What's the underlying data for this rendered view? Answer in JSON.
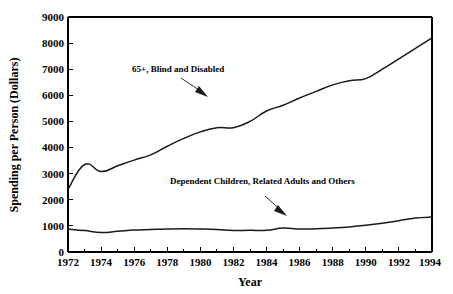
{
  "chart_data": {
    "type": "line",
    "title": "",
    "xlabel": "Year",
    "ylabel": "Spending per Person (Dollars)",
    "xlim": [
      1972,
      1994
    ],
    "ylim": [
      0,
      9000
    ],
    "grid": false,
    "legend": "none (in-plot annotations with arrows)",
    "x": [
      1972,
      1973,
      1974,
      1975,
      1976,
      1977,
      1978,
      1979,
      1980,
      1981,
      1982,
      1983,
      1984,
      1985,
      1986,
      1987,
      1988,
      1989,
      1990,
      1991,
      1992,
      1993,
      1994
    ],
    "xticks": [
      1972,
      1974,
      1976,
      1978,
      1980,
      1982,
      1984,
      1986,
      1988,
      1990,
      1992,
      1994
    ],
    "xtick_labels": [
      "1972",
      "1974",
      "1976",
      "1978",
      "1980",
      "1982",
      "1984",
      "1986",
      "1988",
      "1990",
      "1992",
      "1994"
    ],
    "yticks": [
      0,
      1000,
      2000,
      3000,
      4000,
      5000,
      6000,
      7000,
      8000,
      9000
    ],
    "ytick_labels": [
      "0",
      "1000",
      "2000",
      "3000",
      "4000",
      "5000",
      "6000",
      "7000",
      "8000",
      "9000"
    ],
    "series": [
      {
        "name": "65+, Blind and Disabled",
        "color": "#1a1a1a",
        "values": [
          2400,
          3350,
          3080,
          3300,
          3520,
          3720,
          4050,
          4350,
          4600,
          4760,
          4760,
          5000,
          5400,
          5620,
          5900,
          6150,
          6400,
          6560,
          6640,
          7000,
          7400,
          7800,
          8200
        ]
      },
      {
        "name": "Dependent Children, Related Adults and Others",
        "color": "#1a1a1a",
        "values": [
          880,
          820,
          750,
          790,
          840,
          860,
          880,
          890,
          880,
          860,
          820,
          830,
          830,
          920,
          880,
          890,
          920,
          960,
          1020,
          1100,
          1200,
          1300,
          1340
        ]
      }
    ],
    "series_tail": {
      "note": "both series dip at 1994 right edge",
      "upper_1993": 8250,
      "upper_1994": 8120,
      "lower_1993": 1340,
      "lower_1994": 1280
    },
    "annotations": [
      {
        "name": "upper-series-annotation",
        "text": "65+, Blind and Disabled",
        "points_to_year": 1981,
        "points_to_value": 5000
      },
      {
        "name": "lower-series-annotation",
        "text": "Dependent Children, Related Adults and Others",
        "points_to_year": 1985,
        "points_to_value": 900
      }
    ]
  },
  "axes": {
    "x_title": "Year",
    "y_title": "Spending per Person (Dollars)"
  }
}
